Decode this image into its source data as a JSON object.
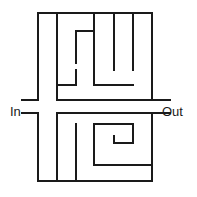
{
  "figure": {
    "type": "maze-puzzle",
    "width": 197,
    "height": 197,
    "background_color": "#ffffff",
    "wall_color": "#1a1a1a",
    "wall_thickness": 2.2
  },
  "labels": {
    "entrance": "In",
    "exit": "Out"
  },
  "maze_data": {
    "bounds": {
      "x1": 38,
      "y1": 13,
      "x2": 152,
      "y2": 181
    },
    "entrance_side": "left",
    "exit_side": "right",
    "walls": [
      {
        "name": "outer-top",
        "x1": 38,
        "y1": 13,
        "x2": 152,
        "y2": 13
      },
      {
        "name": "outer-bottom",
        "x1": 38,
        "y1": 181,
        "x2": 152,
        "y2": 181
      },
      {
        "name": "outer-left-upper",
        "x1": 38,
        "y1": 13,
        "x2": 38,
        "y2": 100
      },
      {
        "name": "outer-left-lower",
        "x1": 38,
        "y1": 113,
        "x2": 38,
        "y2": 181
      },
      {
        "name": "outer-right-upper",
        "x1": 152,
        "y1": 13,
        "x2": 152,
        "y2": 100
      },
      {
        "name": "outer-right-lower",
        "x1": 152,
        "y1": 113,
        "x2": 152,
        "y2": 181
      },
      {
        "name": "in-stub-upper",
        "x1": 22,
        "y1": 100,
        "x2": 38,
        "y2": 100
      },
      {
        "name": "in-stub-lower",
        "x1": 22,
        "y1": 113,
        "x2": 38,
        "y2": 113
      },
      {
        "name": "out-stub-upper",
        "x1": 152,
        "y1": 100,
        "x2": 170,
        "y2": 100
      },
      {
        "name": "out-stub-lower",
        "x1": 152,
        "y1": 113,
        "x2": 170,
        "y2": 113
      },
      {
        "name": "upper-wall-a",
        "x1": 57,
        "y1": 13,
        "x2": 57,
        "y2": 85
      },
      {
        "name": "upper-wall-b",
        "x1": 94,
        "y1": 13,
        "x2": 94,
        "y2": 70
      },
      {
        "name": "upper-wall-c",
        "x1": 114,
        "y1": 13,
        "x2": 114,
        "y2": 70
      },
      {
        "name": "upper-wall-d",
        "x1": 133,
        "y1": 13,
        "x2": 133,
        "y2": 70
      },
      {
        "name": "upper-hook-top",
        "x1": 76,
        "y1": 31,
        "x2": 94,
        "y2": 31
      },
      {
        "name": "upper-hook-left",
        "x1": 76,
        "y1": 31,
        "x2": 76,
        "y2": 63
      },
      {
        "name": "upper-left-elbow-h",
        "x1": 57,
        "y1": 85,
        "x2": 76,
        "y2": 85
      },
      {
        "name": "upper-left-elbow-v",
        "x1": 76,
        "y1": 85,
        "x2": 76,
        "y2": 70
      },
      {
        "name": "upper-right-elbow-h",
        "x1": 94,
        "y1": 85,
        "x2": 133,
        "y2": 85
      },
      {
        "name": "upper-right-elbow-v",
        "x1": 94,
        "y1": 85,
        "x2": 94,
        "y2": 70
      },
      {
        "name": "mid-divider-h",
        "x1": 57,
        "y1": 100,
        "x2": 152,
        "y2": 100
      },
      {
        "name": "mid-divider-v",
        "x1": 57,
        "y1": 100,
        "x2": 57,
        "y2": 85
      },
      {
        "name": "lower-corridor-h",
        "x1": 57,
        "y1": 113,
        "x2": 152,
        "y2": 113
      },
      {
        "name": "lower-corridor-v",
        "x1": 57,
        "y1": 113,
        "x2": 57,
        "y2": 181
      },
      {
        "name": "lower-center-stub",
        "x1": 76,
        "y1": 124,
        "x2": 76,
        "y2": 165
      },
      {
        "name": "lower-center-divider",
        "x1": 76,
        "y1": 165,
        "x2": 76,
        "y2": 181
      },
      {
        "name": "spiral-outer-top",
        "x1": 94,
        "y1": 124,
        "x2": 133,
        "y2": 124
      },
      {
        "name": "spiral-outer-left",
        "x1": 94,
        "y1": 124,
        "x2": 94,
        "y2": 165
      },
      {
        "name": "spiral-outer-right",
        "x1": 133,
        "y1": 124,
        "x2": 133,
        "y2": 143
      },
      {
        "name": "spiral-inner-bottom",
        "x1": 114,
        "y1": 143,
        "x2": 133,
        "y2": 143
      },
      {
        "name": "spiral-inner-left",
        "x1": 114,
        "y1": 143,
        "x2": 114,
        "y2": 136
      },
      {
        "name": "spiral-base",
        "x1": 94,
        "y1": 165,
        "x2": 152,
        "y2": 165
      }
    ]
  }
}
